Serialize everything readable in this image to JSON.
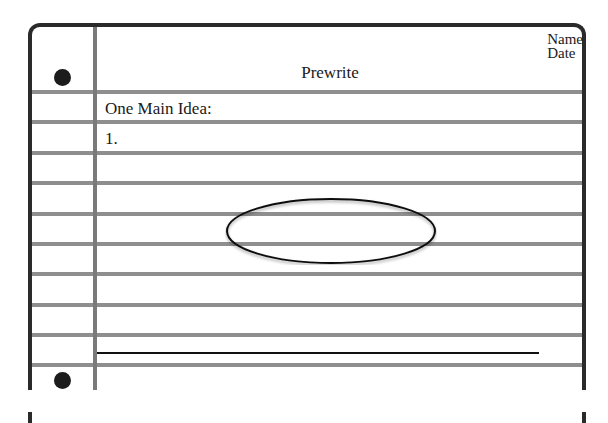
{
  "worksheet": {
    "title": "Prewrite",
    "header_fields": {
      "name_label": "Name",
      "date_label": "Date"
    },
    "prompt": "One Main Idea:",
    "list_item_1": "1.",
    "colors": {
      "frame": "#2a2a2a",
      "rule_lines": "#8e8e8e",
      "margin_line": "#7a7a7a",
      "holes": "#1c1c1c"
    },
    "rule_line_count": 10
  }
}
